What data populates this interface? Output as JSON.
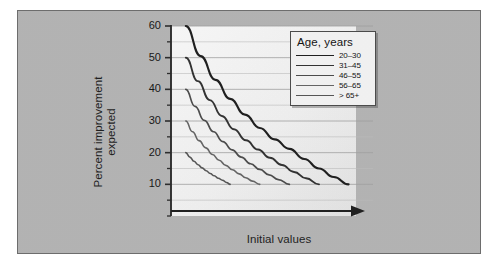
{
  "figure": {
    "panel_bg": "#b3b3b3",
    "plot_bg": "#f3f3f3",
    "axis_color": "#2b2b2b",
    "grid_color": "#9a9a9a"
  },
  "chart_data": {
    "type": "line",
    "title": "",
    "xlabel": "Initial values",
    "ylabel": "Percent improvement expected",
    "ylabel_lines": [
      "Percent improvement",
      "expected"
    ],
    "ylim": [
      0,
      60
    ],
    "yticks": [
      10,
      20,
      30,
      40,
      50,
      60
    ],
    "ytick_labels": [
      "10",
      "20",
      "30",
      "40",
      "50",
      "60"
    ],
    "yminor_ticks": [
      5,
      15,
      25,
      35,
      45,
      55
    ],
    "grid": "horizontal",
    "xticks": [],
    "xtick_labels": [],
    "xlim": [
      0,
      100
    ],
    "x_axis_arrow": true,
    "legend": {
      "title": "Age, years",
      "position": "upper right",
      "entries": [
        {
          "label": "20–30",
          "color": "#1d1d1d",
          "width": 2.1,
          "start_y": 60,
          "end_y": 10,
          "start_x": 8,
          "end_x": 96
        },
        {
          "label": "31–45",
          "color": "#303030",
          "width": 1.9,
          "start_y": 50,
          "end_y": 10,
          "start_x": 8,
          "end_x": 80
        },
        {
          "label": "46–55",
          "color": "#4a4a4a",
          "width": 1.7,
          "start_y": 40,
          "end_y": 10,
          "start_x": 8,
          "end_x": 64
        },
        {
          "label": "56–65",
          "color": "#636363",
          "width": 1.6,
          "start_y": 30,
          "end_y": 10,
          "start_x": 8,
          "end_x": 48
        },
        {
          "label": "> 65+",
          "color": "#545454",
          "width": 1.6,
          "start_y": 20,
          "end_y": 10,
          "start_x": 8,
          "end_x": 32
        }
      ]
    },
    "series": [
      {
        "name": "20–30",
        "color": "#1d1d1d",
        "x": [
          8,
          16,
          24,
          32,
          40,
          48,
          56,
          64,
          72,
          80,
          88,
          96
        ],
        "y": [
          60.0,
          50.5,
          43.0,
          37.0,
          32.0,
          27.8,
          24.2,
          21.2,
          18.0,
          15.0,
          12.3,
          10.0
        ]
      },
      {
        "name": "31–45",
        "color": "#303030",
        "x": [
          8,
          14.5,
          21,
          27.5,
          34,
          40.5,
          47,
          53.5,
          60,
          66.5,
          73,
          80
        ],
        "y": [
          50.0,
          42.6,
          36.6,
          31.6,
          27.4,
          23.9,
          21.0,
          18.4,
          16.1,
          13.9,
          11.9,
          10.0
        ]
      },
      {
        "name": "46–55",
        "color": "#4a4a4a",
        "x": [
          8,
          13,
          18,
          23,
          28,
          33,
          38,
          43,
          48,
          53,
          58,
          64
        ],
        "y": [
          40.0,
          34.6,
          30.2,
          26.6,
          23.5,
          20.9,
          18.6,
          16.5,
          14.7,
          13.0,
          11.5,
          10.0
        ]
      },
      {
        "name": "56–65",
        "color": "#636363",
        "x": [
          8,
          11.6,
          15.2,
          18.8,
          22.4,
          26,
          29.6,
          33.2,
          36.8,
          40.4,
          44,
          48
        ],
        "y": [
          30.0,
          26.6,
          23.8,
          21.5,
          19.4,
          17.6,
          16.0,
          14.6,
          13.3,
          12.1,
          11.0,
          10.0
        ]
      },
      {
        "name": "> 65+",
        "color": "#545454",
        "x": [
          8,
          10.2,
          12.4,
          14.6,
          16.8,
          19,
          21.2,
          23.4,
          25.6,
          27.8,
          30,
          32
        ],
        "y": [
          20.0,
          18.6,
          17.3,
          16.2,
          15.2,
          14.3,
          13.4,
          12.7,
          11.9,
          11.3,
          10.6,
          10.0
        ]
      }
    ]
  }
}
